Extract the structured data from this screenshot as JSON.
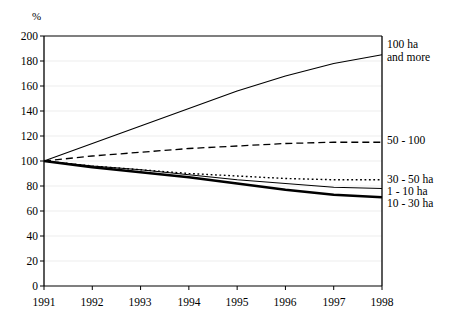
{
  "chart_data": {
    "type": "line",
    "title": "",
    "subtitle": "",
    "xlabel": "",
    "ylabel": "%",
    "unit_label": "%",
    "x": [
      1991,
      1992,
      1993,
      1994,
      1995,
      1996,
      1997,
      1998
    ],
    "xtick_labels": [
      "1991",
      "1992",
      "1993",
      "1994",
      "1995",
      "1996",
      "1997",
      "1998"
    ],
    "xlim": [
      1991,
      1998
    ],
    "ylim": [
      0,
      200
    ],
    "yticks": [
      0,
      20,
      40,
      60,
      80,
      100,
      120,
      140,
      160,
      180,
      200
    ],
    "ytick_labels": [
      "0",
      "20",
      "40",
      "60",
      "80",
      "100",
      "120",
      "140",
      "160",
      "180",
      "200"
    ],
    "grid": true,
    "grid_axis": "y",
    "grid_color": "#e8e8e8",
    "axis_color": "#000000",
    "legend": "right-of-axis end labels",
    "legend_position": "right",
    "series": [
      {
        "name": "100 ha and more",
        "label_lines": [
          "100 ha",
          "and more"
        ],
        "style": "solid",
        "width": 1.1,
        "color": "#000000",
        "values": [
          100,
          114,
          128,
          142,
          156,
          168,
          178,
          185
        ]
      },
      {
        "name": "50 - 100",
        "label_lines": [
          "50 - 100"
        ],
        "style": "dashed",
        "width": 1.3,
        "color": "#000000",
        "values": [
          100,
          104,
          107,
          110,
          112,
          114,
          115,
          115
        ]
      },
      {
        "name": "30 - 50 ha",
        "label_lines": [
          "30 - 50 ha"
        ],
        "style": "dotted",
        "width": 1.4,
        "color": "#000000",
        "values": [
          100,
          96,
          93,
          90,
          88,
          86,
          85,
          85
        ]
      },
      {
        "name": "1 - 10 ha",
        "label_lines": [
          "1 - 10 ha"
        ],
        "style": "solid",
        "width": 1.1,
        "color": "#000000",
        "values": [
          100,
          96,
          93,
          89,
          85,
          82,
          79,
          78
        ]
      },
      {
        "name": "10 - 30 ha",
        "label_lines": [
          "10 - 30 ha"
        ],
        "style": "solid-thick",
        "width": 2.6,
        "color": "#000000",
        "values": [
          100,
          95,
          91,
          87,
          82,
          77,
          73,
          71
        ]
      }
    ]
  },
  "labels": {
    "unit": "%",
    "y": [
      "200",
      "180",
      "160",
      "140",
      "120",
      "100",
      "80",
      "60",
      "40",
      "20",
      "0"
    ],
    "x": [
      "1991",
      "1992",
      "1993",
      "1994",
      "1995",
      "1996",
      "1997",
      "1998"
    ],
    "series_right": [
      {
        "line1": "100 ha",
        "line2": "and more"
      },
      {
        "line1": "50 - 100",
        "line2": ""
      },
      {
        "line1": "30 - 50 ha",
        "line2": ""
      },
      {
        "line1": "1 - 10 ha",
        "line2": ""
      },
      {
        "line1": "10 - 30 ha",
        "line2": ""
      }
    ]
  }
}
